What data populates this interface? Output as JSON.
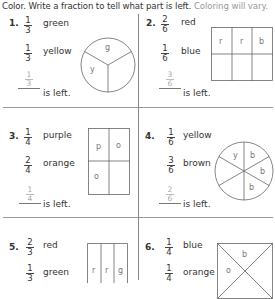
{
  "header": {
    "instruction": "Color. Write a fraction to tell what part is left.",
    "note": "Coloring will vary."
  },
  "problems": [
    {
      "number": "1.",
      "colors": [
        {
          "num": "1",
          "den": "3",
          "name": "green"
        },
        {
          "num": "1",
          "den": "3",
          "name": "yellow"
        }
      ],
      "answer": {
        "num": "1",
        "den": "3"
      },
      "is_left": "is left.",
      "shape": "circle-thirds",
      "labels": [
        "g",
        "y"
      ]
    },
    {
      "number": "2.",
      "colors": [
        {
          "num": "2",
          "den": "6",
          "name": "red"
        },
        {
          "num": "1",
          "den": "6",
          "name": "blue"
        }
      ],
      "answer": {
        "num": "3",
        "den": "6"
      },
      "is_left": "is left.",
      "shape": "rectangle-sixths",
      "labels": [
        "r",
        "r",
        "b"
      ]
    },
    {
      "number": "3.",
      "colors": [
        {
          "num": "1",
          "den": "4",
          "name": "purple"
        },
        {
          "num": "2",
          "den": "4",
          "name": "orange"
        }
      ],
      "answer": {
        "num": "1",
        "den": "4"
      },
      "is_left": "is left.",
      "shape": "rectangle-fourths",
      "labels": [
        "p",
        "o",
        "o"
      ]
    },
    {
      "number": "4.",
      "colors": [
        {
          "num": "1",
          "den": "6",
          "name": "yellow"
        },
        {
          "num": "3",
          "den": "6",
          "name": "brown"
        }
      ],
      "answer": {
        "num": "2",
        "den": "6"
      },
      "is_left": "is left.",
      "shape": "circle-sixths",
      "labels": [
        "y",
        "b",
        "b",
        "b"
      ]
    },
    {
      "number": "5.",
      "colors": [
        {
          "num": "2",
          "den": "3",
          "name": "red"
        },
        {
          "num": "1",
          "den": "3",
          "name": "green"
        }
      ],
      "shape": "rectangle-thirds",
      "labels": [
        "r",
        "r",
        "g"
      ]
    },
    {
      "number": "6.",
      "colors": [
        {
          "num": "1",
          "den": "4",
          "name": "blue"
        },
        {
          "num": "1",
          "den": "4",
          "name": "orange"
        }
      ],
      "shape": "square-diagonal-fourths",
      "labels": [
        "b",
        "o"
      ]
    }
  ]
}
